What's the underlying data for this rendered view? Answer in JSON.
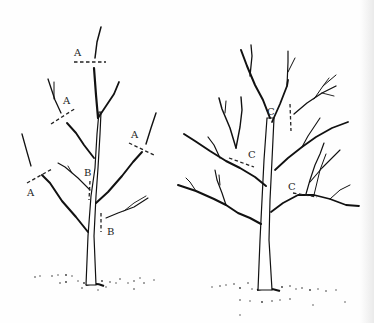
{
  "figure": {
    "left_tree": {
      "name": "young tree (heading and thinning cuts)",
      "labels": [
        {
          "text": "A",
          "x": 74,
          "y": 56
        },
        {
          "text": "A",
          "x": 63,
          "y": 104
        },
        {
          "text": "A",
          "x": 131,
          "y": 138
        },
        {
          "text": "A",
          "x": 27,
          "y": 196
        },
        {
          "text": "B",
          "x": 84,
          "y": 176
        },
        {
          "text": "B",
          "x": 107,
          "y": 235
        }
      ]
    },
    "right_tree": {
      "name": "older tree (thinning cuts)",
      "labels": [
        {
          "text": "C",
          "x": 267,
          "y": 115
        },
        {
          "text": "C",
          "x": 248,
          "y": 158
        },
        {
          "text": "C",
          "x": 288,
          "y": 190
        },
        {
          "text": "C",
          "x": 244,
          "y": 158
        }
      ]
    },
    "colors": {
      "ink": "#111111",
      "paper": "#fefefe"
    }
  }
}
